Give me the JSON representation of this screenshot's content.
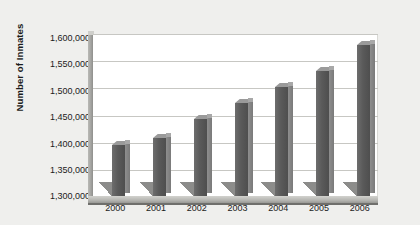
{
  "chart_data": {
    "type": "bar",
    "title": "",
    "subtitle": "",
    "xlabel": "",
    "ylabel": "Number of Inmates",
    "categories": [
      "2000",
      "2001",
      "2002",
      "2003",
      "2004",
      "2005",
      "2006"
    ],
    "values": [
      1395000,
      1408000,
      1443000,
      1473000,
      1503000,
      1532000,
      1580000
    ],
    "series": [
      {
        "name": "Number of Inmates",
        "values": [
          1395000,
          1408000,
          1443000,
          1473000,
          1503000,
          1532000,
          1580000
        ]
      }
    ],
    "ylim": [
      1300000,
      1600000
    ],
    "ytick_step": 50000,
    "ytick_labels": [
      "1,600,000",
      "1,550,000",
      "1,500,000",
      "1,450,000",
      "1,400,000",
      "1,350,000",
      "1,300,000"
    ],
    "ytick_values": [
      1600000,
      1550000,
      1500000,
      1450000,
      1400000,
      1350000,
      1300000
    ],
    "grid": true,
    "grid_orientation": "horizontal",
    "legend": false,
    "legend_position": "none",
    "style_3d": true,
    "colors": {
      "bar_front": "#5a5a5a",
      "bar_side": "#7f7f7f",
      "bar_top": "#9a9a9a",
      "plot_background": "#ffffff",
      "page_background": "#efefed",
      "gridline": "#c7c7c3",
      "text": "#1b1b1b",
      "floor": "#b4b4b0"
    }
  }
}
